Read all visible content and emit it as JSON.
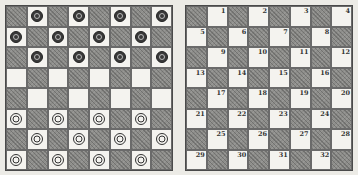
{
  "colors": {
    "dark_square": "#8d8d8a",
    "light_square": "#f4f3ef",
    "border": "#4a4a4a"
  },
  "left_board": {
    "description": "Starting position",
    "rows": [
      [
        "d",
        "b",
        "d",
        "b",
        "d",
        "b",
        "d",
        "b"
      ],
      [
        "b",
        "d",
        "b",
        "d",
        "b",
        "d",
        "b",
        "d"
      ],
      [
        "d",
        "b",
        "d",
        "b",
        "d",
        "b",
        "d",
        "b"
      ],
      [
        "l",
        "d",
        "l",
        "d",
        "l",
        "d",
        "l",
        "d"
      ],
      [
        "d",
        "l",
        "d",
        "l",
        "d",
        "l",
        "d",
        "l"
      ],
      [
        "w",
        "d",
        "w",
        "d",
        "w",
        "d",
        "w",
        "d"
      ],
      [
        "d",
        "w",
        "d",
        "w",
        "d",
        "w",
        "d",
        "w"
      ],
      [
        "w",
        "d",
        "w",
        "d",
        "w",
        "d",
        "w",
        "d"
      ]
    ]
  },
  "right_board": {
    "description": "Numbered squares",
    "numbers": [
      [
        null,
        "1",
        null,
        "2",
        null,
        "3",
        null,
        "4"
      ],
      [
        "5",
        null,
        "6",
        null,
        "7",
        null,
        "8",
        null
      ],
      [
        null,
        "9",
        null,
        "10",
        null,
        "11",
        null,
        "12"
      ],
      [
        "13",
        null,
        "14",
        null,
        "15",
        null,
        "16",
        null
      ],
      [
        null,
        "17",
        null,
        "18",
        null,
        "19",
        null,
        "20"
      ],
      [
        "21",
        null,
        "22",
        null,
        "23",
        null,
        "24",
        null
      ],
      [
        null,
        "25",
        null,
        "26",
        null,
        "27",
        null,
        "28"
      ],
      [
        "29",
        null,
        "30",
        null,
        "31",
        null,
        "32",
        null
      ]
    ]
  }
}
